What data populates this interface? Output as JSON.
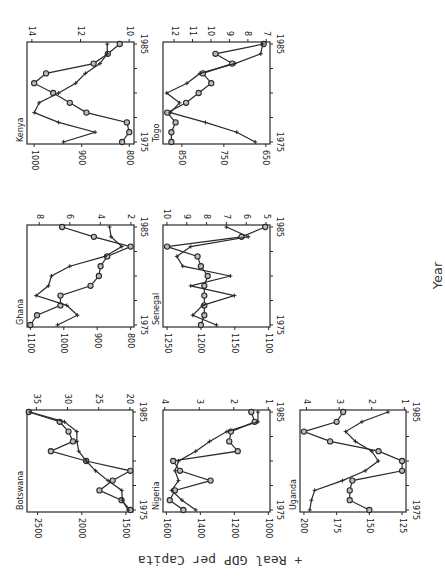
{
  "figure": {
    "y_axis_label": "+ Real GDP per Capita",
    "x_axis_label": "Year"
  },
  "chart_data": [
    {
      "type": "line",
      "title": "Kenya",
      "x": [
        1975,
        1976,
        1977,
        1978,
        1979,
        1980,
        1981,
        1982,
        1983,
        1984,
        1985
      ],
      "xticks": [
        1975,
        1985
      ],
      "left_axis": {
        "ticks": [
          800,
          900,
          1000
        ],
        "range": [
          790,
          1015
        ]
      },
      "right_axis": {
        "ticks": [
          10,
          12,
          14
        ],
        "range": [
          9.8,
          14.2
        ]
      },
      "series": [
        {
          "name": "Real GDP per Capita",
          "marker": "circle",
          "axis": "left",
          "values": [
            815,
            800,
            805,
            890,
            925,
            960,
            1000,
            975,
            875,
            845,
            820
          ]
        },
        {
          "name": "+ series",
          "marker": "plus",
          "axis": "right",
          "values": [
            12.7,
            11.4,
            12.9,
            13.9,
            13.7,
            12.9,
            12.2,
            11.8,
            11.2,
            10.9,
            10.9
          ]
        }
      ],
      "box": [
        27,
        42,
        107,
        102
      ]
    },
    {
      "type": "line",
      "title": "Togo",
      "x": [
        1975,
        1976,
        1977,
        1978,
        1979,
        1980,
        1981,
        1982,
        1983,
        1984,
        1985
      ],
      "xticks": [
        1975,
        1985
      ],
      "left_axis": {
        "ticks": [
          650,
          750,
          850
        ],
        "range": [
          640,
          895
        ]
      },
      "right_axis": {
        "ticks": [
          7,
          8,
          9,
          10,
          11,
          12
        ],
        "range": [
          6.8,
          12.6
        ]
      },
      "series": [
        {
          "name": "Real GDP per Capita",
          "marker": "circle",
          "axis": "left",
          "values": [
            875,
            875,
            865,
            885,
            840,
            810,
            780,
            800,
            730,
            770,
            655
          ]
        },
        {
          "name": "+ series",
          "marker": "plus",
          "axis": "right",
          "values": [
            7.6,
            8.6,
            10.3,
            12.2,
            11.7,
            12.4,
            11.3,
            10.6,
            8.7,
            7.3,
            7.2
          ]
        }
      ],
      "box": [
        163,
        42,
        107,
        102
      ]
    },
    {
      "type": "line",
      "title": "Ghana",
      "x": [
        1975,
        1976,
        1977,
        1978,
        1979,
        1980,
        1981,
        1982,
        1983,
        1984,
        1985
      ],
      "xticks": [
        1975,
        1985
      ],
      "left_axis": {
        "ticks": [
          800,
          900,
          1000,
          1100
        ],
        "range": [
          790,
          1110
        ]
      },
      "right_axis": {
        "ticks": [
          2,
          4,
          6,
          8
        ],
        "range": [
          1.8,
          8.8
        ]
      },
      "series": [
        {
          "name": "Real GDP per Capita",
          "marker": "circle",
          "axis": "left",
          "values": [
            1100,
            1080,
            1010,
            1010,
            920,
            895,
            890,
            870,
            800,
            910,
            1005
          ]
        },
        {
          "name": "+ series",
          "marker": "plus",
          "axis": "right",
          "values": [
            6.8,
            5.5,
            6.2,
            8.2,
            7.4,
            7.2,
            6.0,
            3.7,
            2.6,
            3.3,
            3.4
          ]
        }
      ],
      "box": [
        27,
        225,
        107,
        102
      ]
    },
    {
      "type": "line",
      "title": "Senegal",
      "x": [
        1975,
        1976,
        1977,
        1978,
        1979,
        1980,
        1981,
        1982,
        1983,
        1984,
        1985
      ],
      "xticks": [
        1975,
        1985
      ],
      "left_axis": {
        "ticks": [
          1100,
          1150,
          1200,
          1250
        ],
        "range": [
          1098,
          1256
        ]
      },
      "right_axis": {
        "ticks": [
          5,
          6,
          7,
          8,
          9,
          10
        ],
        "range": [
          4.8,
          10.2
        ]
      },
      "series": [
        {
          "name": "Real GDP per Capita",
          "marker": "circle",
          "axis": "left",
          "values": [
            1200,
            1195,
            1195,
            1195,
            1195,
            1190,
            1200,
            1205,
            1250,
            1140,
            1105
          ]
        },
        {
          "name": "+ series",
          "marker": "plus",
          "axis": "right",
          "values": [
            7.5,
            8.7,
            8.2,
            6.6,
            8.8,
            6.8,
            9.2,
            9.5,
            8.8,
            5.9,
            7.0
          ]
        }
      ],
      "box": [
        163,
        225,
        107,
        102
      ]
    },
    {
      "type": "line",
      "title": "Botswana",
      "x": [
        1975,
        1976,
        1977,
        1978,
        1979,
        1980,
        1981,
        1982,
        1983,
        1984,
        1985
      ],
      "xticks": [
        1975,
        1985
      ],
      "left_axis": {
        "ticks": [
          1500,
          2000,
          2500
        ],
        "range": [
          1420,
          2620
        ]
      },
      "right_axis": {
        "ticks": [
          20,
          25,
          30,
          35
        ],
        "range": [
          19.5,
          36.5
        ]
      },
      "series": [
        {
          "name": "Real GDP per Capita",
          "marker": "circle",
          "axis": "left",
          "values": [
            1450,
            1550,
            1800,
            1650,
            1450,
            1950,
            2350,
            2100,
            2150,
            2250,
            2600
          ]
        },
        {
          "name": "+ series",
          "marker": "plus",
          "axis": "right",
          "values": [
            20.3,
            21.2,
            21.3,
            23.5,
            25.5,
            27.0,
            28.2,
            28.5,
            28.5,
            30.5,
            36.0
          ]
        }
      ],
      "box": [
        27,
        410,
        106,
        102
      ]
    },
    {
      "type": "line",
      "title": "Nigeria",
      "x": [
        1975,
        1976,
        1977,
        1978,
        1979,
        1980,
        1981,
        1982,
        1983,
        1984,
        1985
      ],
      "xticks": [
        1975,
        1985
      ],
      "left_axis": {
        "ticks": [
          1000,
          1200,
          1400,
          1600
        ],
        "range": [
          990,
          1620
        ]
      },
      "right_axis": {
        "ticks": [
          1,
          2,
          3,
          4
        ],
        "range": [
          0.95,
          4.05
        ]
      },
      "series": [
        {
          "name": "Real GDP per Capita",
          "marker": "circle",
          "axis": "left",
          "values": [
            1500,
            1580,
            1550,
            1340,
            1520,
            1560,
            1180,
            1230,
            1220,
            1080,
            1100
          ]
        },
        {
          "name": "+ series",
          "marker": "plus",
          "axis": "right",
          "values": [
            3.1,
            3.5,
            3.8,
            3.6,
            3.7,
            3.6,
            3.1,
            2.7,
            2.2,
            1.3,
            1.3
          ]
        }
      ],
      "box": [
        163,
        410,
        107,
        102
      ]
    },
    {
      "type": "line",
      "title": "Uganda",
      "x": [
        1975,
        1976,
        1977,
        1978,
        1979,
        1980,
        1981,
        1982,
        1983,
        1984,
        1985
      ],
      "xticks": [
        1975,
        1985
      ],
      "left_axis": {
        "ticks": [
          125,
          150,
          175,
          200
        ],
        "range": [
          122,
          203
        ]
      },
      "right_axis": {
        "ticks": [
          1,
          2,
          3,
          4
        ],
        "range": [
          0.95,
          4.2
        ]
      },
      "series": [
        {
          "name": "Real GDP per Capita",
          "marker": "circle",
          "axis": "left",
          "values": [
            150,
            165,
            165,
            163,
            125,
            125,
            143,
            180,
            200,
            175,
            170
          ]
        },
        {
          "name": "+ series",
          "marker": "plus",
          "axis": "right",
          "values": [
            3.9,
            3.85,
            3.75,
            2.9,
            2.2,
            1.8,
            2.0,
            2.5,
            2.8,
            2.3,
            1.5
          ]
        }
      ],
      "box": [
        300,
        410,
        106,
        102
      ]
    }
  ]
}
